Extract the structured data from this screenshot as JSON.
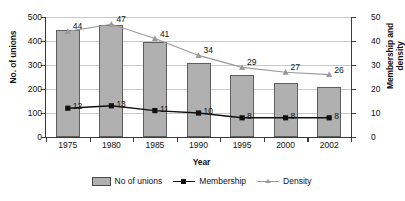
{
  "chart_data": {
    "type": "bar",
    "title": "",
    "xlabel": "Year",
    "ylabel": "No. of unions",
    "y2label": "Membership and density",
    "categories": [
      "1975",
      "1980",
      "1985",
      "1990",
      "1995",
      "2000",
      "2002"
    ],
    "ylim": [
      0,
      500
    ],
    "y2lim": [
      0,
      50
    ],
    "yticks": [
      0,
      100,
      200,
      300,
      400,
      500
    ],
    "y2ticks": [
      0,
      10,
      20,
      30,
      40,
      50
    ],
    "grid": true,
    "legend_position": "bottom",
    "series": [
      {
        "name": "No of unions",
        "type": "bar",
        "axis": "left",
        "color": "#b0b0b0",
        "values": [
          447,
          467,
          395,
          307,
          260,
          225,
          210
        ],
        "labels": [
          "",
          "",
          "",
          "",
          "",
          "",
          ""
        ]
      },
      {
        "name": "Membership",
        "type": "line",
        "axis": "right",
        "color": "#111111",
        "marker": "square",
        "values": [
          12,
          13,
          11,
          10,
          8,
          8,
          8
        ],
        "labels": [
          "12",
          "13",
          "11",
          "10",
          "8",
          "8",
          "8"
        ]
      },
      {
        "name": "Density",
        "type": "line",
        "axis": "right",
        "color": "#9a9a9a",
        "marker": "triangle",
        "values": [
          44,
          47,
          41,
          34,
          29,
          27,
          26
        ],
        "labels": [
          "44",
          "47",
          "41",
          "34",
          "29",
          "27",
          "26"
        ]
      }
    ]
  },
  "axes": {
    "y_left_title": "No. of unions",
    "y_right_title_line1": "Membership and",
    "y_right_title_line2": "density",
    "x_title": "Year"
  },
  "legend": {
    "items": [
      {
        "label": "No of unions"
      },
      {
        "label": "Membership"
      },
      {
        "label": "Density"
      }
    ]
  }
}
